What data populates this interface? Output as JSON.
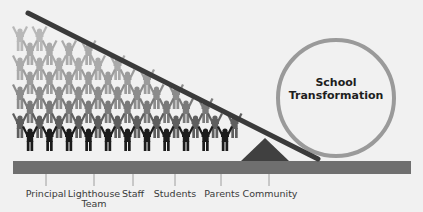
{
  "diagram": {
    "type": "lever-metaphor",
    "circle_label_line1": "School",
    "circle_label_line2": "Transformation",
    "labels": [
      {
        "text": "Principal",
        "x": 46
      },
      {
        "text": "Lighthouse",
        "x": 93,
        "text2": "Team"
      },
      {
        "text": "Staff",
        "x": 133
      },
      {
        "text": "Students",
        "x": 175
      },
      {
        "text": "Parents",
        "x": 222
      },
      {
        "text": "Community",
        "x": 270
      }
    ],
    "colors": {
      "background": "#f1f1f1",
      "lever": "#3a3a3a",
      "fulcrum": "#404040",
      "ground_bar": "#6f6f6f",
      "circle_stroke": "#9a9a9a",
      "figure_shades": [
        "#1c1c1c",
        "#5e5e5e",
        "#7a7a7a",
        "#8c8c8c",
        "#9c9c9c",
        "#aaaaaa",
        "#b8b8b8"
      ]
    }
  }
}
